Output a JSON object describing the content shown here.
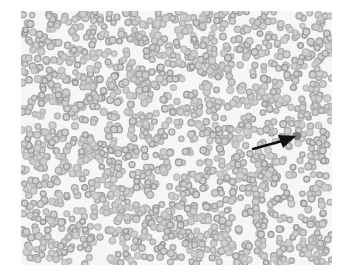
{
  "image": {
    "description": "Grayscale light-microscopy field of a blood smear showing densely packed round red blood cells, with a black arrow pointing to a single darker cell.",
    "background_color": "#f6f6f6",
    "cell_color": "#a9a9a9",
    "cell_center_color": "#cfcfcf",
    "highlight_cell_color": "#7a7a7a",
    "arrow_color": "#111111",
    "seed": 1337,
    "cell_count": 1700
  },
  "annotation": {
    "type": "arrow",
    "from": [
      253,
      149
    ],
    "to": [
      294,
      137
    ],
    "target_label": "abnormal-cell"
  }
}
